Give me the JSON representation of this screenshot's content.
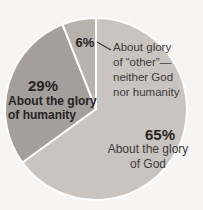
{
  "chart_data": {
    "type": "pie",
    "title": "",
    "start_angle_deg": -90,
    "direction": "clockwise",
    "divider_color": "#ffffff",
    "slices": [
      {
        "label": "About the glory of God",
        "pct_label": "65%",
        "value": 65,
        "color": "#cac4c1"
      },
      {
        "label": "About the glory of humanity",
        "pct_label": "29%",
        "value": 29,
        "color": "#a49e9c"
      },
      {
        "label": "About glory of “other”—neither God nor humanity",
        "pct_label": "6%",
        "value": 6,
        "color": "#b8b2af"
      }
    ],
    "legend_position": "none",
    "labels_on_chart": true
  },
  "labels": {
    "pct6": "6%",
    "other_line1": "About glory",
    "other_line2": "of “other”—",
    "other_line3": "neither God",
    "other_line4": "nor humanity",
    "pct29": "29%",
    "humanity_line1": "About the glory",
    "humanity_line2": "of humanity",
    "pct65": "65%",
    "god_line1": "About the glory",
    "god_line2": "of God"
  },
  "colors": {
    "background": "#f7f5f3",
    "text_regular": "#3c3a39",
    "text_bold": "#262423",
    "leader_line": "#3a3836"
  }
}
